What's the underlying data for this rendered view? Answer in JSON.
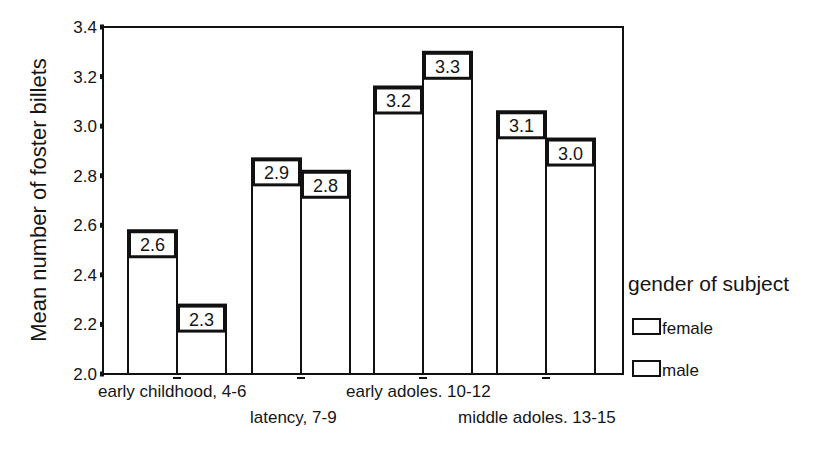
{
  "chart_data": {
    "type": "bar",
    "title": "",
    "xlabel": "",
    "ylabel": "Mean number of foster billets",
    "ylim": [
      2.0,
      3.4
    ],
    "yticks": [
      "2.0",
      "2.2",
      "2.4",
      "2.6",
      "2.8",
      "3.0",
      "3.2",
      "3.4"
    ],
    "grid": false,
    "categories": [
      "early childhood, 4-6",
      "latency, 7-9",
      "early adoles. 10-12",
      "middle adoles. 13-15"
    ],
    "series": [
      {
        "name": "female",
        "values": [
          2.58,
          2.87,
          3.16,
          3.06
        ],
        "labels": [
          "2.6",
          "2.9",
          "3.2",
          "3.1"
        ]
      },
      {
        "name": "male",
        "values": [
          2.28,
          2.82,
          3.3,
          2.95
        ],
        "labels": [
          "2.3",
          "2.8",
          "3.3",
          "3.0"
        ]
      }
    ],
    "legend": {
      "title": "gender of subject",
      "position": "right",
      "entries": [
        "female",
        "male"
      ]
    }
  },
  "colors": {
    "bar_fill": "#ffffff",
    "stroke": "#111111",
    "text": "#151515"
  }
}
